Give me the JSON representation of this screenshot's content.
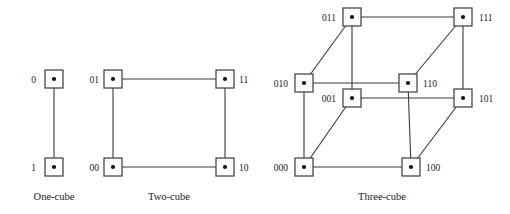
{
  "figure": {
    "background": "#ffffff",
    "stroke_color": "#3a3a3a",
    "node_fill": "#ffffff",
    "dot_color": "#111111",
    "text_color": "#1a1a1a"
  },
  "chart_data": {
    "type": "diagram",
    "title": "",
    "diagram_kind": "hypercube-graphs",
    "panels": [
      {
        "id": "one-cube",
        "caption": "One-cube",
        "dimension": 1,
        "node_count": 2,
        "edge_count": 1,
        "nodes": [
          {
            "id": "0",
            "label": "0",
            "x": 54,
            "y": 79,
            "label_x": 36,
            "label_y": 83,
            "label_anchor": "end"
          },
          {
            "id": "1",
            "label": "1",
            "x": 54,
            "y": 167,
            "label_x": 36,
            "label_y": 171,
            "label_anchor": "end"
          }
        ],
        "edges": [
          [
            "0",
            "1"
          ]
        ]
      },
      {
        "id": "two-cube",
        "caption": "Two-cube",
        "dimension": 2,
        "node_count": 4,
        "edge_count": 4,
        "nodes": [
          {
            "id": "01",
            "label": "01",
            "x": 113,
            "y": 79,
            "label_x": 99,
            "label_y": 83,
            "label_anchor": "end"
          },
          {
            "id": "11",
            "label": "11",
            "x": 225,
            "y": 79,
            "label_x": 239,
            "label_y": 83,
            "label_anchor": "start"
          },
          {
            "id": "00",
            "label": "00",
            "x": 113,
            "y": 167,
            "label_x": 99,
            "label_y": 171,
            "label_anchor": "end"
          },
          {
            "id": "10",
            "label": "10",
            "x": 225,
            "y": 167,
            "label_x": 239,
            "label_y": 171,
            "label_anchor": "start"
          }
        ],
        "edges": [
          [
            "01",
            "11"
          ],
          [
            "00",
            "10"
          ],
          [
            "01",
            "00"
          ],
          [
            "11",
            "10"
          ]
        ]
      },
      {
        "id": "three-cube",
        "caption": "Three-cube",
        "dimension": 3,
        "node_count": 8,
        "edge_count": 12,
        "nodes": [
          {
            "id": "011",
            "label": "011",
            "x": 352,
            "y": 17,
            "label_x": 336,
            "label_y": 21,
            "label_anchor": "end"
          },
          {
            "id": "111",
            "label": "111",
            "x": 463,
            "y": 17,
            "label_x": 479,
            "label_y": 21,
            "label_anchor": "start"
          },
          {
            "id": "010",
            "label": "010",
            "x": 304,
            "y": 83,
            "label_x": 288,
            "label_y": 87,
            "label_anchor": "end"
          },
          {
            "id": "110",
            "label": "110",
            "x": 408,
            "y": 83,
            "label_x": 423,
            "label_y": 87,
            "label_anchor": "start"
          },
          {
            "id": "001",
            "label": "001",
            "x": 352,
            "y": 98,
            "label_x": 336,
            "label_y": 102,
            "label_anchor": "end"
          },
          {
            "id": "101",
            "label": "101",
            "x": 463,
            "y": 98,
            "label_x": 479,
            "label_y": 102,
            "label_anchor": "start"
          },
          {
            "id": "000",
            "label": "000",
            "x": 304,
            "y": 167,
            "label_x": 288,
            "label_y": 171,
            "label_anchor": "end"
          },
          {
            "id": "100",
            "label": "100",
            "x": 411,
            "y": 167,
            "label_x": 426,
            "label_y": 171,
            "label_anchor": "start"
          }
        ],
        "edges": [
          [
            "011",
            "111"
          ],
          [
            "010",
            "110"
          ],
          [
            "001",
            "101"
          ],
          [
            "000",
            "100"
          ],
          [
            "011",
            "001"
          ],
          [
            "111",
            "101"
          ],
          [
            "010",
            "000"
          ],
          [
            "110",
            "100"
          ],
          [
            "011",
            "010"
          ],
          [
            "111",
            "110"
          ],
          [
            "001",
            "000"
          ],
          [
            "101",
            "100"
          ]
        ]
      }
    ],
    "captions": [
      "One-cube",
      "Two-cube",
      "Three-cube"
    ],
    "caption_positions": [
      {
        "x": 54,
        "y": 200
      },
      {
        "x": 169,
        "y": 200
      },
      {
        "x": 382,
        "y": 200
      }
    ],
    "node_box_size": 18
  }
}
